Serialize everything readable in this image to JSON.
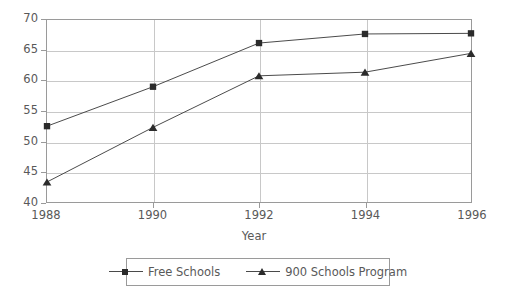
{
  "chart_data": {
    "type": "line",
    "title": "",
    "subtitle": "",
    "xlabel": "Year",
    "ylabel": "",
    "categories": [
      "1988",
      "1990",
      "1992",
      "1994",
      "1996"
    ],
    "x": [
      1988,
      1990,
      1992,
      1994,
      1996
    ],
    "series": [
      {
        "name": "Free Schools",
        "marker": "square",
        "color": "#2b2b2b",
        "values": [
          52.5,
          59.0,
          66.2,
          67.7,
          67.8
        ]
      },
      {
        "name": "900 Schools Program",
        "marker": "triangle",
        "color": "#2b2b2b",
        "values": [
          43.3,
          52.3,
          60.8,
          61.4,
          64.5
        ]
      }
    ],
    "ylim": [
      40,
      70
    ],
    "xlim": [
      1988,
      1996
    ],
    "yticks": [
      40,
      45,
      50,
      55,
      60,
      65,
      70
    ],
    "xticks": [
      "1988",
      "1990",
      "1992",
      "1994",
      "1996"
    ],
    "grid": true,
    "grid_axis": "both",
    "legend_position": "bottom",
    "legend_entries": [
      "Free Schools",
      "900 Schools Program"
    ],
    "colors": {
      "line": "#4a4a4a",
      "marker": "#2b2b2b",
      "grid": "#c8c8c8",
      "axis": "#9a9a9a",
      "text": "#595959",
      "background": "#ffffff"
    }
  }
}
